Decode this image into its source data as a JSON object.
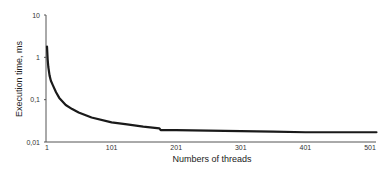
{
  "chart_data": {
    "type": "line",
    "title": "",
    "xlabel": "Numbers of threads",
    "ylabel": "Execution time, ms",
    "yscale": "log",
    "ylim": [
      0.01,
      10
    ],
    "xlim": [
      1,
      511
    ],
    "grid": false,
    "legend": null,
    "x_ticks": [
      "1",
      "101",
      "201",
      "301",
      "401",
      "501"
    ],
    "x_tick_values": [
      1,
      101,
      201,
      301,
      401,
      501
    ],
    "y_ticks": [
      "10",
      "1",
      "0,1",
      "0,01"
    ],
    "y_tick_values": [
      10,
      1,
      0.1,
      0.01
    ],
    "series": [
      {
        "name": "Execution time",
        "color": "#1a1a1a",
        "x": [
          1,
          2,
          3,
          5,
          7,
          10,
          15,
          20,
          30,
          40,
          50,
          70,
          101,
          125,
          150,
          175,
          177,
          201,
          251,
          301,
          351,
          401,
          451,
          501,
          511
        ],
        "values": [
          1.8,
          0.9,
          0.6,
          0.37,
          0.28,
          0.22,
          0.15,
          0.11,
          0.075,
          0.06,
          0.05,
          0.038,
          0.029,
          0.026,
          0.023,
          0.021,
          0.019,
          0.019,
          0.0185,
          0.018,
          0.0175,
          0.017,
          0.017,
          0.017,
          0.017
        ]
      }
    ]
  }
}
